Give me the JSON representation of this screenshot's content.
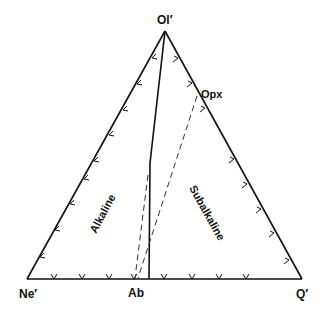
{
  "diagram": {
    "type": "ternary",
    "vertices": {
      "top": "Ol′",
      "left": "Ne′",
      "right": "Q′"
    },
    "points": {
      "opx": "Opx",
      "ab": "Ab"
    },
    "fields": {
      "left": "Alkaline",
      "right": "Subalkaline"
    },
    "line_color": "#111111",
    "background": "#ffffff"
  }
}
